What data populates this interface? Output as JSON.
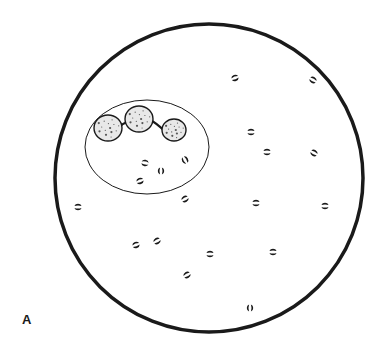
{
  "figure": {
    "panel_label": "A",
    "colors": {
      "ink": "#1a1a1a",
      "background": "#ffffff",
      "nucleus_fill": "#e8e8e8"
    },
    "field": {
      "cx": 209,
      "cy": 178,
      "r": 154,
      "stroke_width": 3.5
    },
    "neutrophil": {
      "membrane": {
        "cx": 147,
        "cy": 147,
        "rx": 62,
        "ry": 47
      },
      "nucleus_lobes": [
        {
          "cx": 108,
          "cy": 128,
          "rx": 14,
          "ry": 13
        },
        {
          "cx": 139,
          "cy": 119,
          "rx": 14,
          "ry": 13
        },
        {
          "cx": 174,
          "cy": 130,
          "rx": 12,
          "ry": 11
        }
      ],
      "intracellular_diplococci": [
        {
          "x": 145,
          "y": 163,
          "rot": 10
        },
        {
          "x": 161,
          "y": 171,
          "rot": 90
        },
        {
          "x": 140,
          "y": 181,
          "rot": -20
        },
        {
          "x": 185,
          "y": 160,
          "rot": 60
        }
      ]
    },
    "extracellular_diplococci": [
      {
        "x": 235,
        "y": 78,
        "rot": -20
      },
      {
        "x": 313,
        "y": 80,
        "rot": 30
      },
      {
        "x": 251,
        "y": 132,
        "rot": 0
      },
      {
        "x": 267,
        "y": 152,
        "rot": 0
      },
      {
        "x": 314,
        "y": 153,
        "rot": 30
      },
      {
        "x": 78,
        "y": 207,
        "rot": 0
      },
      {
        "x": 185,
        "y": 199,
        "rot": -30
      },
      {
        "x": 256,
        "y": 203,
        "rot": 0
      },
      {
        "x": 325,
        "y": 206,
        "rot": 0
      },
      {
        "x": 136,
        "y": 245,
        "rot": -20
      },
      {
        "x": 157,
        "y": 241,
        "rot": -30
      },
      {
        "x": 210,
        "y": 254,
        "rot": 0
      },
      {
        "x": 273,
        "y": 252,
        "rot": 0
      },
      {
        "x": 187,
        "y": 275,
        "rot": -30
      },
      {
        "x": 250,
        "y": 308,
        "rot": 90
      }
    ]
  }
}
